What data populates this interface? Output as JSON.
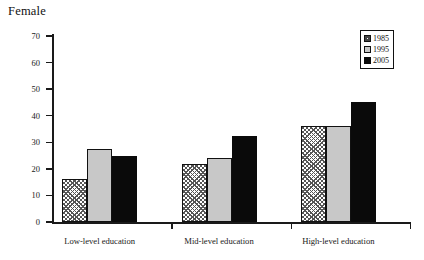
{
  "chart_data": {
    "type": "bar",
    "title": "Female",
    "xlabel": "",
    "ylabel": "",
    "ylim": [
      0,
      70
    ],
    "yticks": [
      0,
      10,
      20,
      30,
      40,
      50,
      60,
      70
    ],
    "grid": false,
    "legend_position": "top-right",
    "categories": [
      "Low-level education",
      "Mid-level education",
      "High-level education"
    ],
    "series": [
      {
        "name": "1985",
        "fill": "crosshatch",
        "color": "#ffffff",
        "values": [
          16,
          22,
          36
        ]
      },
      {
        "name": "1995",
        "fill": "solid",
        "color": "#c8c8c8",
        "values": [
          27.5,
          24,
          36
        ]
      },
      {
        "name": "2005",
        "fill": "solid",
        "color": "#0a0a0a",
        "values": [
          25,
          32.5,
          45
        ]
      }
    ]
  },
  "axis": {
    "tick_labels": [
      "70",
      "60",
      "50",
      "40",
      "30",
      "20",
      "10",
      "0"
    ]
  },
  "legend": {
    "entries": [
      {
        "label": "1985"
      },
      {
        "label": "1995"
      },
      {
        "label": "2005"
      }
    ]
  }
}
